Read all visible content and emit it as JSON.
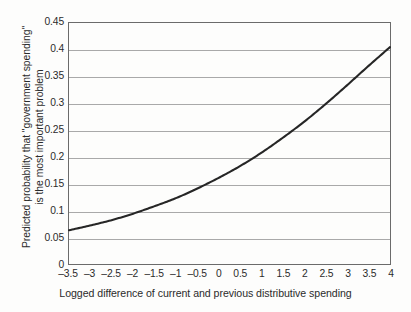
{
  "chart_data": {
    "type": "line",
    "title": "",
    "xlabel": "Logged difference of current and previous distributive spending",
    "ylabel_line1": "Predicted probability that \"government spending\"",
    "ylabel_line2": "is the most important problem",
    "xlim": [
      -3.5,
      4
    ],
    "ylim": [
      0,
      0.45
    ],
    "grid": true,
    "legend": "none",
    "line_color": "#262626",
    "grid_color": "#a9a9a9",
    "axis_color": "#6b6b6b",
    "xticks": [
      "-3.5",
      "-3",
      "-2.5",
      "-2",
      "-1.5",
      "-1",
      "-0.5",
      "0",
      "0.5",
      "1",
      "1.5",
      "2",
      "2.5",
      "3",
      "3.5",
      "4"
    ],
    "xtick_values": [
      -3.5,
      -3,
      -2.5,
      -2,
      -1.5,
      -1,
      -0.5,
      0,
      0.5,
      1,
      1.5,
      2,
      2.5,
      3,
      3.5,
      4
    ],
    "yticks": [
      "0",
      "0.05",
      "0.1",
      "0.15",
      "0.2",
      "0.25",
      "0.3",
      "0.35",
      "0.4",
      "0.45"
    ],
    "ytick_values": [
      0,
      0.05,
      0.1,
      0.15,
      0.2,
      0.25,
      0.3,
      0.35,
      0.4,
      0.45
    ],
    "series": [
      {
        "name": "Predicted probability",
        "x": [
          -3.5,
          -3.0,
          -2.5,
          -2.0,
          -1.5,
          -1.0,
          -0.5,
          0.0,
          0.5,
          1.0,
          1.5,
          2.0,
          2.5,
          3.0,
          3.5,
          4.0
        ],
        "y": [
          0.063,
          0.072,
          0.082,
          0.094,
          0.108,
          0.123,
          0.141,
          0.161,
          0.183,
          0.208,
          0.236,
          0.266,
          0.299,
          0.334,
          0.37,
          0.405
        ]
      }
    ]
  }
}
